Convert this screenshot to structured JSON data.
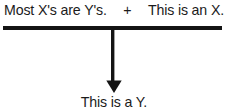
{
  "diagram": {
    "type": "logical-inference",
    "premises": [
      {
        "id": "major-premise",
        "text": "Most X's are Y's."
      },
      {
        "id": "minor-premise",
        "text": "This is an X."
      }
    ],
    "conjunction_symbol": "+",
    "conclusion": {
      "id": "conclusion",
      "text": "This is a Y."
    },
    "inference_bar": {
      "name": "inference-rule-bar",
      "color": "#141414"
    },
    "arrow": {
      "name": "downward-arrow",
      "direction": "down",
      "color": "#141414"
    },
    "colors": {
      "background": "#ffffff",
      "ink": "#1b1b1b",
      "rule": "#141414"
    }
  }
}
